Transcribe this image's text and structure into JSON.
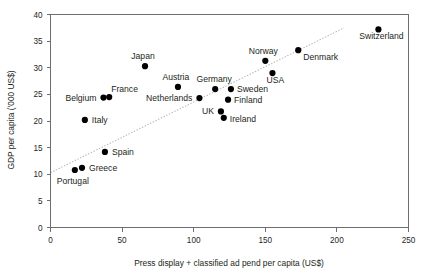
{
  "chart_data": {
    "type": "scatter",
    "title": "",
    "xlabel": "Press display + classified ad pend per capita (US$)",
    "ylabel": "GDP per capita ('000 US$)",
    "xlim": [
      0,
      250
    ],
    "ylim": [
      0,
      40
    ],
    "xticks": [
      0,
      50,
      100,
      150,
      200,
      250
    ],
    "yticks": [
      0,
      5,
      10,
      15,
      20,
      25,
      30,
      35,
      40
    ],
    "xtick_labels": [
      "0",
      "50",
      "100",
      "150",
      "200",
      "250"
    ],
    "ytick_labels": [
      "0",
      "5",
      "10",
      "15",
      "20",
      "25",
      "30",
      "35",
      "40"
    ],
    "grid": false,
    "legend": false,
    "marker_color": "#000000",
    "trendline": {
      "show": true,
      "style": "dotted",
      "color": "#b9b9b9",
      "x0": 0,
      "y0": 10.3,
      "x1": 205,
      "y1": 37.5
    },
    "points": [
      {
        "label": "Portugal",
        "x": 17,
        "y": 10.8,
        "label_dx": -2,
        "label_dy": 14,
        "anchor": "middle"
      },
      {
        "label": "Greece",
        "x": 22,
        "y": 11.2,
        "label_dx": 7,
        "label_dy": 3,
        "anchor": "start"
      },
      {
        "label": "Spain",
        "x": 38,
        "y": 14.2,
        "label_dx": 7,
        "label_dy": 3,
        "anchor": "start"
      },
      {
        "label": "Italy",
        "x": 24,
        "y": 20.2,
        "label_dx": 7,
        "label_dy": 3,
        "anchor": "start"
      },
      {
        "label": "Belgium",
        "x": 37,
        "y": 24.4,
        "label_dx": -7,
        "label_dy": 3,
        "anchor": "end"
      },
      {
        "label": "France",
        "x": 41,
        "y": 24.5,
        "label_dx": 2,
        "label_dy": -5,
        "anchor": "start"
      },
      {
        "label": "Japan",
        "x": 66,
        "y": 30.3,
        "label_dx": -2,
        "label_dy": -7,
        "anchor": "middle"
      },
      {
        "label": "Austria",
        "x": 89,
        "y": 26.4,
        "label_dx": -2,
        "label_dy": -7,
        "anchor": "middle"
      },
      {
        "label": "Netherlands",
        "x": 104,
        "y": 24.3,
        "label_dx": -7,
        "label_dy": 3,
        "anchor": "end"
      },
      {
        "label": "Germany",
        "x": 115,
        "y": 26.0,
        "label_dx": -1,
        "label_dy": -7,
        "anchor": "middle"
      },
      {
        "label": "UK",
        "x": 119,
        "y": 21.8,
        "label_dx": -7,
        "label_dy": 3,
        "anchor": "end"
      },
      {
        "label": "Ireland",
        "x": 121,
        "y": 20.6,
        "label_dx": 6,
        "label_dy": 4,
        "anchor": "start"
      },
      {
        "label": "Sweden",
        "x": 126,
        "y": 26.0,
        "label_dx": 6,
        "label_dy": 3,
        "anchor": "start"
      },
      {
        "label": "Finland",
        "x": 124,
        "y": 24.0,
        "label_dx": 6,
        "label_dy": 3,
        "anchor": "start"
      },
      {
        "label": "Norway",
        "x": 150,
        "y": 31.3,
        "label_dx": -2,
        "label_dy": -7,
        "anchor": "middle"
      },
      {
        "label": "USA",
        "x": 155,
        "y": 29.0,
        "label_dx": 3,
        "label_dy": 10,
        "anchor": "middle"
      },
      {
        "label": "Denmark",
        "x": 173,
        "y": 33.3,
        "label_dx": 5,
        "label_dy": 10,
        "anchor": "start"
      },
      {
        "label": "Switzerland",
        "x": 229,
        "y": 37.2,
        "label_dx": 3,
        "label_dy": 10,
        "anchor": "middle"
      }
    ]
  }
}
